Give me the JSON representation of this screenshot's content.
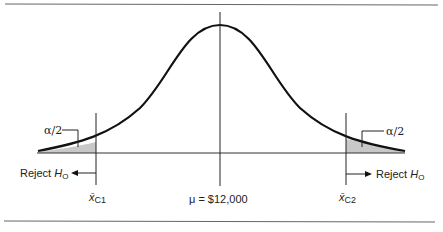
{
  "diagram": {
    "type": "two-tailed hypothesis test normal curve",
    "labels": {
      "alpha_left": "α/2",
      "alpha_right": "α/2",
      "reject_left": "Reject ",
      "reject_right": "Reject ",
      "h_letter": "H",
      "h_sub": "O",
      "mean": "μ = $12,000",
      "xbar": "x̄",
      "c1_sub": "C1",
      "c2_sub": "C2"
    },
    "colors": {
      "line": "#111111",
      "shade": "#c8c8c8",
      "rule": "#666666"
    }
  }
}
